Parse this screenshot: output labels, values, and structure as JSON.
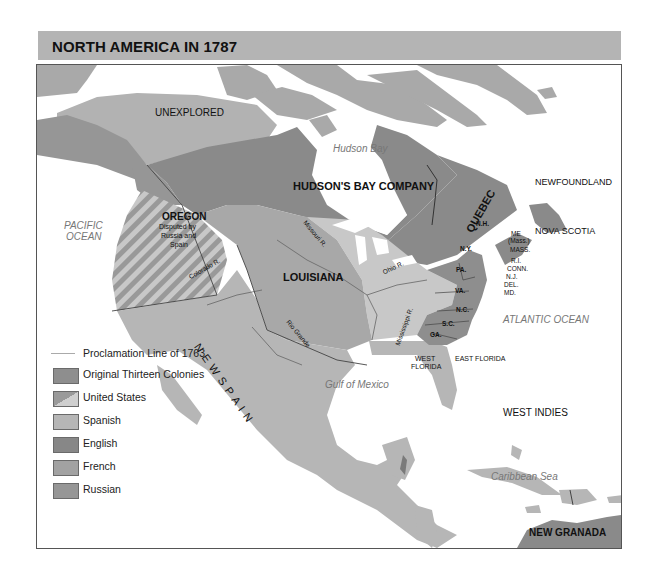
{
  "header": {
    "title": "NORTH AMERICA IN 1787"
  },
  "colors": {
    "header_band": "#b4b4b4",
    "original_thirteen": "#8e8e8e",
    "united_states": "#c6c6c6",
    "spanish": "#b6b6b6",
    "english": "#878787",
    "french": "#a2a2a2",
    "russian": "#969696",
    "water": "#ffffff"
  },
  "map": {
    "regions": {
      "unexplored": "UNEXPLORED",
      "hudsons_bay_company": "HUDSON'S BAY COMPANY",
      "quebec": "QUEBEC",
      "newfoundland": "NEWFOUNDLAND",
      "nova_scotia": "NOVA SCOTIA",
      "oregon": "OREGON",
      "oregon_note_1": "Disputed by",
      "oregon_note_2": "Russia and",
      "oregon_note_3": "Spain",
      "louisiana": "LOUISIANA",
      "new_spain": "N E W   S P A I N",
      "west_florida_1": "WEST",
      "west_florida_2": "FLORIDA",
      "east_florida": "EAST FLORIDA",
      "west_indies": "WEST INDIES",
      "new_granada": "NEW GRANADA"
    },
    "colonies": {
      "nh": "N.H.",
      "me_1": "ME",
      "me_2": "(Mass.)",
      "mass": "MASS.",
      "ri": "R.I.",
      "conn": "CONN.",
      "nj": "N.J.",
      "del": "DEL.",
      "md": "MD.",
      "ny": "N.Y.",
      "pa": "PA.",
      "va": "VA.",
      "nc": "N.C.",
      "sc": "S.C.",
      "ga": "GA."
    },
    "rivers": {
      "missouri": "Missouri R.",
      "ohio": "Ohio R.",
      "mississippi": "Mississippi R.",
      "colorado": "Colorado R.",
      "rio_grande": "Rio Grande"
    },
    "water": {
      "hudson_bay": "Hudson Bay",
      "pacific_1": "PACIFIC",
      "pacific_2": "OCEAN",
      "atlantic": "ATLANTIC OCEAN",
      "gulf": "Gulf of Mexico",
      "caribbean": "Caribbean Sea"
    }
  },
  "legend": {
    "items": [
      {
        "label": "Proclamation Line of 1763",
        "kind": "line"
      },
      {
        "label": "Original Thirteen Colonies",
        "kind": "original_thirteen"
      },
      {
        "label": "United States",
        "kind": "united_states"
      },
      {
        "label": "Spanish",
        "kind": "spanish"
      },
      {
        "label": "English",
        "kind": "english"
      },
      {
        "label": "French",
        "kind": "french"
      },
      {
        "label": "Russian",
        "kind": "russian"
      }
    ]
  }
}
